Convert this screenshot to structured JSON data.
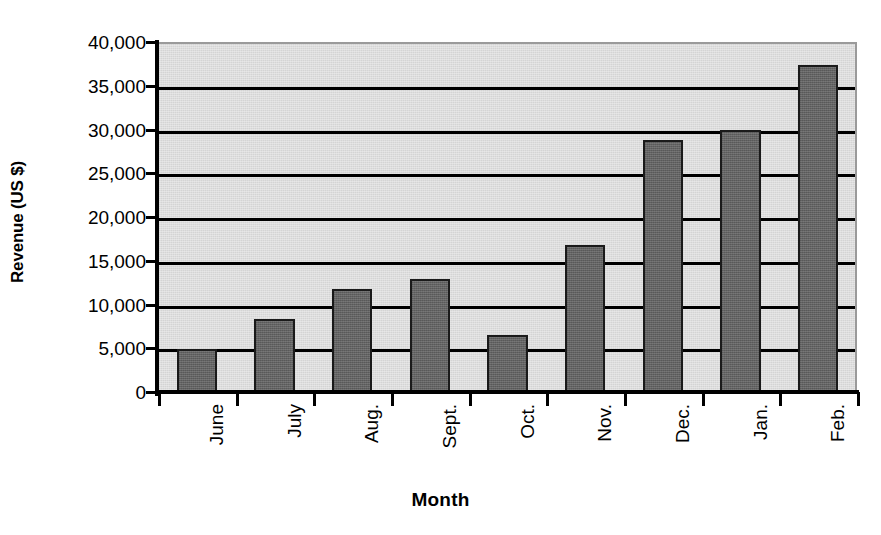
{
  "chart_data": {
    "type": "bar",
    "title": "",
    "xlabel": "Month",
    "ylabel": "Revenue (US $)",
    "categories": [
      "June",
      "July",
      "Aug.",
      "Sept.",
      "Oct.",
      "Nov.",
      "Dec.",
      "Jan.",
      "Feb."
    ],
    "values": [
      4900,
      8300,
      11800,
      12900,
      6500,
      16800,
      28800,
      29900,
      37400
    ],
    "series": [
      {
        "name": "Revenue",
        "values": [
          4900,
          8300,
          11800,
          12900,
          6500,
          16800,
          28800,
          29900,
          37400
        ]
      }
    ],
    "ylim": [
      0,
      40000
    ],
    "ytick_step": 5000,
    "ytick_labels": [
      "40,000",
      "35,000",
      "30,000",
      "25,000",
      "20,000",
      "15,000",
      "10,000",
      "5,000",
      "0"
    ],
    "ytick_values": [
      40000,
      35000,
      30000,
      25000,
      20000,
      15000,
      10000,
      5000,
      0
    ],
    "grid": true,
    "grid_axis": "y",
    "legend": false,
    "legend_position": "none",
    "colors": {
      "bar_fill": "#636363",
      "bar_edge": "#1a1a1a",
      "plot_background": "#d4d4d4",
      "gridline": "#000000",
      "axis": "#000000",
      "text": "#000000",
      "figure_background": "#ffffff"
    }
  }
}
